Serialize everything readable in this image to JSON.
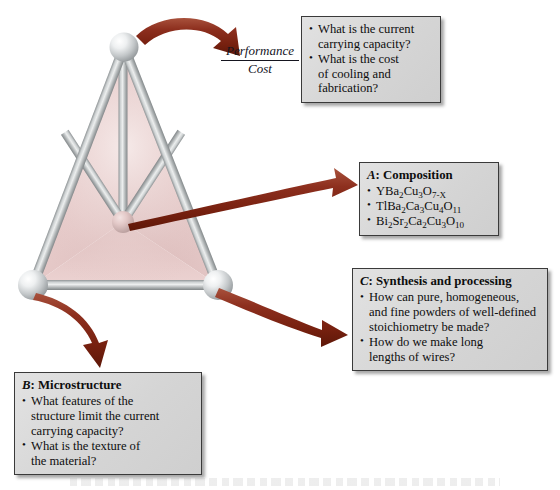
{
  "figure": {
    "ratio_label": {
      "numerator": "Performance",
      "denominator": "Cost"
    },
    "tetrahedron": {
      "name": "materials-tetrahedron",
      "face_color": "#e8cfce",
      "rod_color": "#b9bcbd",
      "node_color": "#d9dcdd",
      "center_node_color": "#d8bdbc"
    },
    "arrow_color": "#8a2b1c"
  },
  "boxes": {
    "performance": {
      "name": "performance-cost-box",
      "items": [
        [
          "What is the current",
          "carrying capacity?"
        ],
        [
          "What is the cost",
          "of cooling and",
          "fabrication?"
        ]
      ]
    },
    "composition": {
      "name": "composition-box",
      "letter": "A",
      "title": ": Composition",
      "items": [
        [
          "YBa2Cu3O7-X"
        ],
        [
          "TlBa2Ca3Cu4O11"
        ],
        [
          "Bi2Sr2Ca2Cu3O10"
        ]
      ],
      "formulas": [
        {
          "parts": [
            [
              "Y",
              ""
            ],
            [
              "Ba",
              "2"
            ],
            [
              "Cu",
              "3"
            ],
            [
              "O",
              "7-X"
            ]
          ]
        },
        {
          "parts": [
            [
              "TlBa",
              "2"
            ],
            [
              "Ca",
              "3"
            ],
            [
              "Cu",
              "4"
            ],
            [
              "O",
              "11"
            ]
          ]
        },
        {
          "parts": [
            [
              "Bi",
              "2"
            ],
            [
              "Sr",
              "2"
            ],
            [
              "Ca",
              "2"
            ],
            [
              "Cu",
              "3"
            ],
            [
              "O",
              "10"
            ]
          ]
        }
      ]
    },
    "synthesis": {
      "name": "synthesis-box",
      "letter": "C",
      "title": ": Synthesis and processing",
      "items": [
        [
          "How can pure, homogeneous,",
          "and fine powders of well-defined",
          "stoichiometry be made?"
        ],
        [
          "How do we make long",
          "lengths of wires?"
        ]
      ]
    },
    "microstructure": {
      "name": "microstructure-box",
      "letter": "B",
      "title": ": Microstructure",
      "items": [
        [
          "What features of the",
          "structure limit the current",
          "carrying capacity?"
        ],
        [
          "What is the texture of",
          "the material?"
        ]
      ]
    }
  }
}
